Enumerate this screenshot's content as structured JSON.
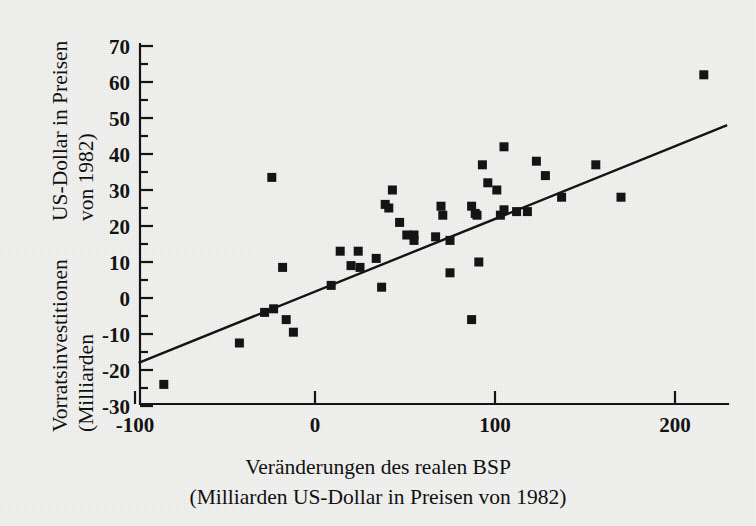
{
  "figure": {
    "background_color": "#f3f3f1",
    "ink_color": "#141414"
  },
  "axis_titles": {
    "y_line_1": "Vorratsinvestitionen (Milliarden",
    "y_line_2": "US-Dollar in Preisen von 1982)",
    "x_line_1": "Veränderungen des realen BSP",
    "x_line_2": "(Milliarden US-Dollar in Preisen von 1982)"
  },
  "chart_data": {
    "type": "scatter",
    "title": "",
    "xlabel": "Veränderungen des realen BSP (Milliarden US-Dollar in Preisen von 1982)",
    "ylabel": "Vorratsinvestitionen (Milliarden US-Dollar in Preisen von 1982)",
    "xlim": [
      -100,
      230
    ],
    "ylim": [
      -30,
      70
    ],
    "xticks": [
      -100,
      0,
      100,
      200
    ],
    "xtick_labels": [
      "-100",
      "0",
      "100",
      "200"
    ],
    "yticks": [
      -30,
      -20,
      -10,
      0,
      10,
      20,
      30,
      40,
      50,
      60,
      70
    ],
    "ytick_labels": [
      "-30",
      "-20",
      "-10",
      "0",
      "10",
      "20",
      "30",
      "40",
      "50",
      "60",
      "70"
    ],
    "y_minor_ticks": true,
    "grid": false,
    "legend": null,
    "marker": "square",
    "marker_color": "#141414",
    "marker_size_px": 9,
    "points": [
      [
        -84,
        -24
      ],
      [
        -42,
        -12.5
      ],
      [
        -28,
        -4
      ],
      [
        -23,
        -3
      ],
      [
        -16,
        -6
      ],
      [
        -12,
        -9.5
      ],
      [
        -24,
        33.5
      ],
      [
        -18,
        8.5
      ],
      [
        9,
        3.5
      ],
      [
        14,
        13
      ],
      [
        20,
        9
      ],
      [
        24,
        13
      ],
      [
        25,
        8.5
      ],
      [
        34,
        11
      ],
      [
        37,
        3
      ],
      [
        39,
        26
      ],
      [
        41,
        25
      ],
      [
        43,
        30
      ],
      [
        47,
        21
      ],
      [
        51,
        17.5
      ],
      [
        55,
        17.5
      ],
      [
        55,
        16
      ],
      [
        67,
        17
      ],
      [
        70,
        25.5
      ],
      [
        71,
        23
      ],
      [
        75,
        16
      ],
      [
        75,
        7
      ],
      [
        87,
        25.5
      ],
      [
        87,
        -6
      ],
      [
        89,
        23.5
      ],
      [
        90,
        23
      ],
      [
        91,
        10
      ],
      [
        93,
        37
      ],
      [
        96,
        32
      ],
      [
        101,
        30
      ],
      [
        103,
        23
      ],
      [
        105,
        42
      ],
      [
        105,
        24.5
      ],
      [
        112,
        24
      ],
      [
        118,
        24
      ],
      [
        123,
        38
      ],
      [
        128,
        34
      ],
      [
        137,
        28
      ],
      [
        156,
        37
      ],
      [
        170,
        28
      ],
      [
        216,
        62
      ]
    ],
    "regression_line": {
      "x_start": -98,
      "y_start": -18,
      "x_end": 229,
      "y_end": 48,
      "color": "#141414",
      "width_px": 2.4
    }
  }
}
